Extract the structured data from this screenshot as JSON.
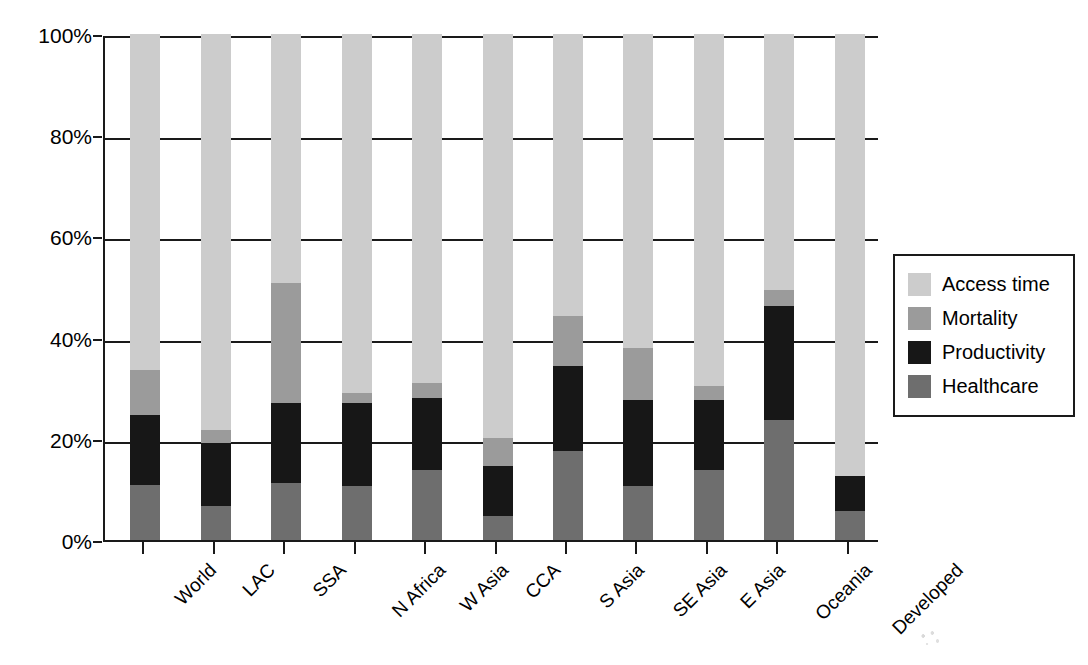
{
  "chart_data": {
    "type": "bar",
    "subtype": "stacked-100-percent",
    "title": "",
    "xlabel": "",
    "ylabel": "",
    "ylim": [
      0,
      100
    ],
    "y_tick_labels": [
      "100%",
      "80%",
      "60%",
      "40%",
      "20%",
      "0%"
    ],
    "y_ticks": [
      100,
      80,
      60,
      40,
      20,
      0
    ],
    "grid": true,
    "legend_position": "right",
    "categories": [
      "World",
      "LAC",
      "SSA",
      "N Africa",
      "W Asia",
      "CCA",
      "S Asia",
      "SE Asia",
      "E Asia",
      "Oceania",
      "Developed"
    ],
    "series": [
      {
        "name": "Healthcare",
        "color": "#6e6e6e",
        "values": [
          10.9,
          6.7,
          11.3,
          10.7,
          13.9,
          4.7,
          17.6,
          10.7,
          13.9,
          23.7,
          5.7
        ]
      },
      {
        "name": "Productivity",
        "color": "#171717",
        "values": [
          13.8,
          12.5,
          15.8,
          16.4,
          14.2,
          9.9,
          16.8,
          17.0,
          13.8,
          22.5,
          6.9
        ]
      },
      {
        "name": "Mortality",
        "color": "#9b9b9b",
        "values": [
          8.9,
          2.6,
          23.7,
          2.0,
          3.0,
          5.5,
          9.9,
          10.3,
          2.8,
          3.2,
          0.0
        ]
      },
      {
        "name": "Access time",
        "color": "#cccccc",
        "values": [
          66.4,
          78.2,
          49.2,
          70.9,
          68.9,
          79.9,
          55.7,
          62.0,
          69.5,
          50.6,
          87.4
        ]
      }
    ],
    "legend_entries": [
      {
        "label": "Access time",
        "color": "#cccccc"
      },
      {
        "label": "Mortality",
        "color": "#9b9b9b"
      },
      {
        "label": "Productivity",
        "color": "#171717"
      },
      {
        "label": "Healthcare",
        "color": "#6e6e6e"
      }
    ]
  }
}
